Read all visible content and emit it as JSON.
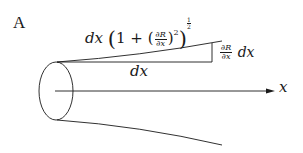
{
  "figure": {
    "panel_label": "A",
    "arc_length_label": {
      "prefix": "dx",
      "open_paren": "(",
      "one_plus": "1 + (",
      "frac_num": "∂R",
      "frac_den": "∂x",
      "close_inner": ")",
      "square": "2",
      "close_outer": ")",
      "power_num": "1",
      "power_den": "2"
    },
    "rise_label": {
      "frac_num": "∂R",
      "frac_den": "∂x",
      "suffix": "dx"
    },
    "run_label": "dx",
    "axis_label": "x",
    "colors": {
      "stroke": "#1a1a1a",
      "background": "#ffffff"
    }
  }
}
